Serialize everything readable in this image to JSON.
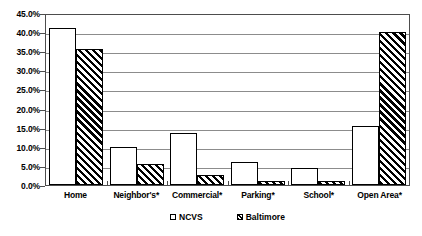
{
  "chart_data": {
    "type": "bar",
    "title": "",
    "subtitle": "",
    "xlabel": "",
    "ylabel": "",
    "categories": [
      "Home",
      "Neighbor's*",
      "Commercial*",
      "Parking*",
      "School*",
      "Open Area*"
    ],
    "series": [
      {
        "name": "NCVS",
        "values": [
          41.0,
          10.0,
          13.5,
          6.0,
          4.5,
          15.5
        ],
        "pattern": "solid-white",
        "color": "#ffffff"
      },
      {
        "name": "Baltimore",
        "values": [
          35.5,
          5.5,
          2.5,
          1.0,
          1.0,
          40.0
        ],
        "pattern": "diagonal-hatch",
        "color": "#000000"
      }
    ],
    "ylim": [
      0,
      45
    ],
    "ytick_step": 5,
    "ytick_labels": [
      "45.0%",
      "40.0%",
      "35.0%",
      "30.0%",
      "25.0%",
      "20.0%",
      "15.0%",
      "10.0%",
      "5.0%",
      "0.0%"
    ],
    "ytick_values": [
      45,
      40,
      35,
      30,
      25,
      20,
      15,
      10,
      5,
      0
    ],
    "grid": true,
    "grid_axis": "y",
    "legend": [
      "NCVS",
      "Baltimore"
    ],
    "legend_position": "bottom"
  }
}
